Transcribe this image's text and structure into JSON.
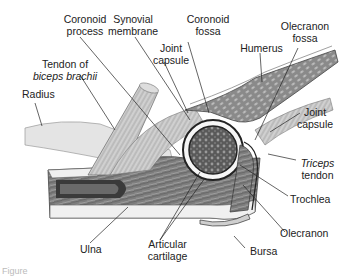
{
  "figure": {
    "labels": {
      "coronoid_process": [
        "Coronoid",
        "process"
      ],
      "synovial_membrane": [
        "Synovial",
        "membrane"
      ],
      "coronoid_fossa": [
        "Coronoid",
        "fossa"
      ],
      "olecranon_fossa": [
        "Olecranon",
        "fossa"
      ],
      "joint_capsule_top": [
        "Joint",
        "capsule"
      ],
      "humerus": "Humerus",
      "tendon_biceps": [
        "Tendon of",
        "biceps brachii"
      ],
      "radius": "Radius",
      "joint_capsule_right": [
        "Joint",
        "capsule"
      ],
      "triceps_tendon": [
        "Triceps",
        "tendon"
      ],
      "trochlea": "Trochlea",
      "olecranon": "Olecranon",
      "ulna": "Ulna",
      "articular_cartilage": [
        "Articular",
        "cartilage"
      ],
      "bursa": "Bursa"
    },
    "caption": "Figure"
  },
  "colors": {
    "bone_dark": "#4a4a4a",
    "bone_mid": "#8a8a8a",
    "cartilage": "#f4f4f4",
    "muscle": "#b8b8b8",
    "line": "#333333"
  }
}
